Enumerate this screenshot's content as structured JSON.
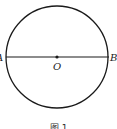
{
  "figure": {
    "caption": "图 1",
    "circle": {
      "cx": 57,
      "cy": 57,
      "r": 51,
      "stroke": "#1a1a1a"
    },
    "diameter": {
      "from": "A",
      "to": "B"
    },
    "points": [
      {
        "name": "A",
        "label": "A",
        "x": 6,
        "y": 57
      },
      {
        "name": "O",
        "label": "O",
        "x": 57,
        "y": 57
      },
      {
        "name": "B",
        "label": "B",
        "x": 109,
        "y": 57
      }
    ]
  }
}
